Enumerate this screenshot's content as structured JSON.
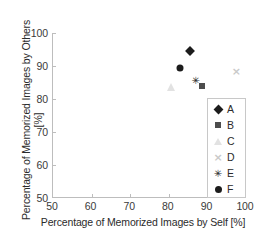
{
  "chart_data": {
    "type": "scatter",
    "title": "",
    "xlabel": "Percentage of Memorized Images by Self [%]",
    "ylabel": "Percentage of Memorized Images by Others [%]",
    "xlim": [
      50,
      100
    ],
    "ylim": [
      50,
      100
    ],
    "xticks": [
      "50",
      "60",
      "70",
      "80",
      "90",
      "100"
    ],
    "yticks": [
      "50",
      "60",
      "70",
      "80",
      "90",
      "100"
    ],
    "grid": false,
    "legend_position": "lower-right-inside",
    "series": [
      {
        "name": "A",
        "marker": "diamond",
        "color": "#1c1c1c",
        "x": 85.5,
        "y": 94.4
      },
      {
        "name": "B",
        "marker": "square",
        "color": "#4d4d4d",
        "x": 88.5,
        "y": 83.8
      },
      {
        "name": "C",
        "marker": "triangle",
        "color": "#e2e2e2",
        "x": 80.5,
        "y": 83.5
      },
      {
        "name": "D",
        "marker": "cross-x",
        "color": "#c9c9c9",
        "x": 97.5,
        "y": 88.5
      },
      {
        "name": "E",
        "marker": "asterisk",
        "color": "#2b2b2b",
        "x": 87.0,
        "y": 85.7
      },
      {
        "name": "F",
        "marker": "circle",
        "color": "#1c1c1c",
        "x": 83.0,
        "y": 89.4
      }
    ]
  },
  "legend": {
    "items": [
      {
        "label": "A"
      },
      {
        "label": "B"
      },
      {
        "label": "C"
      },
      {
        "label": "D"
      },
      {
        "label": "E"
      },
      {
        "label": "F"
      }
    ]
  },
  "glyphs": {
    "cross_x": "×",
    "asterisk": "✳"
  }
}
